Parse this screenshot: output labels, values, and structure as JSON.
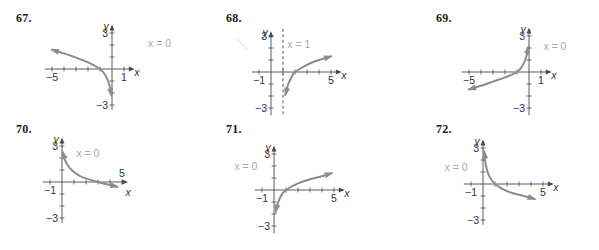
{
  "chart_data": [
    {
      "id": "67",
      "type": "line",
      "title": "67.",
      "xlabel": "x",
      "ylabel": "y",
      "xlim": [
        -5,
        1
      ],
      "ylim": [
        -3,
        3
      ],
      "x_tick_labels": [
        "-5",
        "1"
      ],
      "y_tick_labels": [
        "3",
        "-3"
      ],
      "asymptote": {
        "label": "x = 0",
        "x": 0,
        "dashed": false
      },
      "series": [
        {
          "name": "curve",
          "description": "decreasing log-type curve through (-1,0), falling to -inf as x->0-, arrow toward left",
          "points": [
            [
              -5,
              1.6
            ],
            [
              -4,
              1.3
            ],
            [
              -3,
              0.95
            ],
            [
              -2,
              0.55
            ],
            [
              -1,
              0
            ],
            [
              -0.5,
              -0.6
            ],
            [
              -0.2,
              -1.4
            ],
            [
              -0.05,
              -2.2
            ]
          ]
        }
      ]
    },
    {
      "id": "68",
      "type": "line",
      "title": "68.",
      "xlabel": "x",
      "ylabel": "y",
      "xlim": [
        -1,
        5
      ],
      "ylim": [
        -3,
        3
      ],
      "x_tick_labels": [
        "-1",
        "5"
      ],
      "y_tick_labels": [
        "3",
        "-3"
      ],
      "asymptote": {
        "label": "x = 1",
        "x": 1,
        "dashed": true
      },
      "series": [
        {
          "name": "curve",
          "description": "increasing log curve through (2,0), asymptote x=1, arrow toward right",
          "points": [
            [
              1.2,
              -1.9
            ],
            [
              1.4,
              -1.1
            ],
            [
              1.7,
              -0.45
            ],
            [
              2,
              0
            ],
            [
              3,
              0.6
            ],
            [
              4,
              1.0
            ],
            [
              5,
              1.3
            ]
          ]
        }
      ]
    },
    {
      "id": "69",
      "type": "line",
      "title": "69.",
      "xlabel": "x",
      "ylabel": "y",
      "xlim": [
        -5,
        1
      ],
      "ylim": [
        -3,
        3
      ],
      "x_tick_labels": [
        "-5",
        "1"
      ],
      "y_tick_labels": [
        "3",
        "-3"
      ],
      "asymptote": {
        "label": "x = 0",
        "x": 0,
        "dashed": false
      },
      "series": [
        {
          "name": "curve",
          "description": "increasing curve through (-1,0), rising to +inf as x->0-, arrow toward lower left",
          "points": [
            [
              -5,
              -1.45
            ],
            [
              -4,
              -1.15
            ],
            [
              -3,
              -0.8
            ],
            [
              -2,
              -0.45
            ],
            [
              -1,
              0
            ],
            [
              -0.5,
              0.6
            ],
            [
              -0.2,
              1.35
            ],
            [
              -0.05,
              2.1
            ]
          ]
        }
      ]
    },
    {
      "id": "70",
      "type": "line",
      "title": "70.",
      "xlabel": "x",
      "ylabel": "y",
      "xlim": [
        -1,
        5
      ],
      "ylim": [
        -3,
        3
      ],
      "x_tick_labels": [
        "-1",
        "5"
      ],
      "y_tick_labels": [
        "3",
        "-3"
      ],
      "asymptote": {
        "label": "x = 0",
        "x": 0,
        "dashed": false
      },
      "series": [
        {
          "name": "curve",
          "description": "decreasing curve through (3,0), rising to +inf as x->0+, arrow toward right",
          "points": [
            [
              0.05,
              2.5
            ],
            [
              0.3,
              1.7
            ],
            [
              0.8,
              1.0
            ],
            [
              1.5,
              0.5
            ],
            [
              2,
              0.3
            ],
            [
              3,
              0
            ],
            [
              4,
              -0.25
            ],
            [
              4.6,
              -0.4
            ]
          ]
        }
      ]
    },
    {
      "id": "71",
      "type": "line",
      "title": "71.",
      "xlabel": "x",
      "ylabel": "y",
      "xlim": [
        -1,
        5
      ],
      "ylim": [
        -3,
        3
      ],
      "x_tick_labels": [
        "-1",
        "5"
      ],
      "y_tick_labels": [
        "3",
        "-3"
      ],
      "asymptote": {
        "label": "x = 0",
        "x": 0,
        "dashed": false
      },
      "series": [
        {
          "name": "curve",
          "description": "increasing log curve through (1,0), asymptote x=0, arrow toward right",
          "points": [
            [
              0.15,
              -1.8
            ],
            [
              0.3,
              -1.15
            ],
            [
              0.6,
              -0.45
            ],
            [
              1,
              0
            ],
            [
              2,
              0.55
            ],
            [
              3,
              0.9
            ],
            [
              4,
              1.15
            ],
            [
              4.8,
              1.4
            ]
          ]
        }
      ]
    },
    {
      "id": "72",
      "type": "line",
      "title": "72.",
      "xlabel": "x",
      "ylabel": "y",
      "xlim": [
        -1,
        5
      ],
      "ylim": [
        -3,
        3
      ],
      "x_tick_labels": [
        "-1",
        "5"
      ],
      "y_tick_labels": [
        "3",
        "-3"
      ],
      "asymptote": {
        "label": "x = 0",
        "x": 0,
        "dashed": false
      },
      "series": [
        {
          "name": "curve",
          "description": "decreasing log curve through (1,0), rising to +inf as x->0+, arrow toward right",
          "points": [
            [
              0.1,
              2.7
            ],
            [
              0.25,
              1.5
            ],
            [
              0.5,
              0.7
            ],
            [
              1,
              0
            ],
            [
              2,
              -0.6
            ],
            [
              3,
              -0.9
            ],
            [
              4,
              -1.15
            ],
            [
              4.3,
              -1.25
            ]
          ]
        }
      ]
    }
  ],
  "problems": [
    {
      "label": "67.",
      "pos": [
        16,
        12
      ]
    },
    {
      "label": "68.",
      "pos": [
        226,
        12
      ]
    },
    {
      "label": "69.",
      "pos": [
        436,
        12
      ]
    },
    {
      "label": "70.",
      "pos": [
        16,
        123
      ]
    },
    {
      "label": "71.",
      "pos": [
        226,
        123
      ]
    },
    {
      "label": "72.",
      "pos": [
        436,
        123
      ]
    }
  ],
  "layout": {
    "unit_px": 12,
    "origins": [
      [
        112,
        69
      ],
      [
        271,
        72
      ],
      [
        529,
        72
      ],
      [
        62,
        182
      ],
      [
        274,
        190
      ],
      [
        483,
        184
      ]
    ],
    "x_axis_extent": [
      [
        -5.6,
        1.9
      ],
      [
        -1.6,
        5.9
      ],
      [
        -5.6,
        1.9
      ],
      [
        -1.6,
        5.5
      ],
      [
        -1.6,
        5.9
      ],
      [
        -1.6,
        5.9
      ]
    ],
    "y_axis_extent": [
      [
        -3.4,
        3.7
      ],
      [
        -3.6,
        3.4
      ],
      [
        -3.6,
        3.7
      ],
      [
        -3.4,
        3.7
      ],
      [
        -3.6,
        3.7
      ],
      [
        -3.4,
        3.7
      ]
    ],
    "x_label_offset": [
      [
        10,
        3
      ],
      [
        10,
        3
      ],
      [
        10,
        3
      ],
      [
        8,
        10
      ],
      [
        10,
        3
      ],
      [
        10,
        3
      ]
    ],
    "asym_label_pos": [
      [
        [
          3,
          2.15
        ]
      ],
      [
        [
          1.35,
          2.3
        ]
      ],
      [
        [
          1.2,
          2.15
        ]
      ],
      [
        [
          1.2,
          2.45
        ]
      ],
      [
        [
          -3.3,
          2.0
        ]
      ],
      [
        [
          -3.2,
          1.45
        ]
      ]
    ],
    "curve_color": "#8c8c8c",
    "axis_color": "#4a4a4a",
    "asymptote_label_color": "#a9a9a9"
  }
}
